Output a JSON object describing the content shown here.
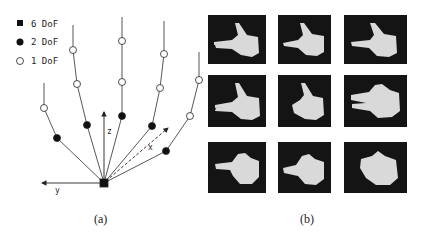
{
  "panel_a": {
    "caption": "(a)",
    "legend": [
      {
        "marker": "filled-square",
        "label": "6 DoF"
      },
      {
        "marker": "filled-circle",
        "label": "2 DoF"
      },
      {
        "marker": "open-circle",
        "label": "1 DoF"
      }
    ],
    "axes": {
      "x": "x",
      "y": "y",
      "z": "z"
    },
    "root": {
      "x": 104,
      "y": 183,
      "dof": 6
    },
    "fingers": [
      {
        "name": "thumb",
        "nodes": [
          [
            57,
            138,
            "2"
          ],
          [
            44,
            108,
            "1"
          ]
        ],
        "tip": [
          44,
          83
        ]
      },
      {
        "name": "index",
        "nodes": [
          [
            87,
            125,
            "2"
          ],
          [
            77,
            84,
            "1"
          ],
          [
            73,
            50,
            "1"
          ]
        ],
        "tip": [
          73,
          25
        ]
      },
      {
        "name": "middle",
        "nodes": [
          [
            122,
            116,
            "2"
          ],
          [
            122,
            82,
            "1"
          ],
          [
            122,
            41,
            "1"
          ]
        ],
        "tip": [
          122,
          17
        ]
      },
      {
        "name": "ring",
        "nodes": [
          [
            152,
            126,
            "2"
          ],
          [
            160,
            88,
            "1"
          ],
          [
            164,
            54,
            "1"
          ]
        ],
        "tip": [
          164,
          21
        ]
      },
      {
        "name": "little",
        "nodes": [
          [
            166,
            151,
            "2"
          ],
          [
            190,
            116,
            "1"
          ],
          [
            199,
            80,
            "1"
          ]
        ],
        "tip": [
          199,
          52
        ]
      }
    ]
  },
  "panel_b": {
    "caption": "(b)",
    "grid": {
      "rows": 3,
      "cols": 3
    },
    "tiles": [
      {
        "pose": "two-fingers-thumb-up"
      },
      {
        "pose": "index-thumb-up"
      },
      {
        "pose": "index-thumb-up"
      },
      {
        "pose": "two-fingers-thumb-up"
      },
      {
        "pose": "thumb-up-fist"
      },
      {
        "pose": "two-fingers-thumb-flat"
      },
      {
        "pose": "index-point"
      },
      {
        "pose": "index-point-short"
      },
      {
        "pose": "fist"
      }
    ]
  }
}
